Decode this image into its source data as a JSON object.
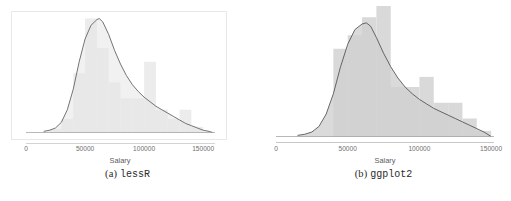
{
  "figure": {
    "panels": [
      {
        "id": "lessR",
        "caption_prefix": "(a)",
        "caption_pkg": "lessR",
        "frame": true,
        "frame_color": "#e8e8e8",
        "axis_label": "Salary",
        "tick_labels": [
          "0",
          "50000",
          "100000",
          "150000"
        ],
        "bar_color": "#ececec",
        "fill_color": "#e6e6e6",
        "curve_color": "#5c5c5c",
        "axis_color": "#c9c9c9"
      },
      {
        "id": "ggplot2",
        "caption_prefix": "(b)",
        "caption_pkg": "ggplot2",
        "frame": false,
        "frame_color": "#ffffff",
        "axis_label": "Salary",
        "tick_labels": [
          "0",
          "50000",
          "100000",
          "150000"
        ],
        "bar_color": "#d9d9d9",
        "fill_color": "#cfcfcf",
        "curve_color": "#4f4f4f",
        "axis_color": "#b9b9b9"
      }
    ]
  },
  "chart_data": [
    {
      "type": "area",
      "title": "",
      "subtitle": "",
      "xlabel": "Salary",
      "ylabel": "",
      "xlim": [
        0,
        160000
      ],
      "ylim": [
        0,
        1
      ],
      "xticks": [
        0,
        50000,
        100000,
        150000
      ],
      "xticklabels": [
        "0",
        "50000",
        "100000",
        "150000"
      ],
      "grid": false,
      "legend": "none",
      "series": [
        {
          "name": "histogram",
          "type": "bar",
          "bin_width": 10000,
          "bin_starts": [
            20000,
            30000,
            40000,
            50000,
            60000,
            70000,
            80000,
            90000,
            100000,
            110000,
            120000,
            130000,
            140000
          ],
          "values": [
            0.03,
            0.12,
            0.52,
            1.0,
            0.74,
            0.44,
            0.3,
            0.3,
            0.62,
            0.2,
            0.12,
            0.2,
            0.05
          ]
        },
        {
          "name": "density",
          "type": "line",
          "x": [
            15000,
            20000,
            25000,
            30000,
            35000,
            40000,
            45000,
            50000,
            55000,
            60000,
            62000,
            65000,
            70000,
            75000,
            80000,
            85000,
            90000,
            95000,
            100000,
            105000,
            110000,
            115000,
            120000,
            125000,
            130000,
            135000,
            140000,
            145000,
            150000,
            155000,
            158000
          ],
          "y": [
            0.01,
            0.02,
            0.04,
            0.09,
            0.2,
            0.38,
            0.62,
            0.82,
            0.94,
            0.99,
            1.0,
            0.97,
            0.86,
            0.72,
            0.6,
            0.5,
            0.42,
            0.36,
            0.31,
            0.27,
            0.23,
            0.2,
            0.17,
            0.14,
            0.11,
            0.08,
            0.06,
            0.04,
            0.02,
            0.01,
            0.0
          ]
        }
      ]
    },
    {
      "type": "area",
      "title": "",
      "subtitle": "",
      "xlabel": "Salary",
      "ylabel": "",
      "xlim": [
        0,
        152000
      ],
      "ylim": [
        0,
        1
      ],
      "xticks": [
        0,
        50000,
        100000,
        150000
      ],
      "xticklabels": [
        "0",
        "50000",
        "100000",
        "150000"
      ],
      "grid": false,
      "legend": "none",
      "series": [
        {
          "name": "histogram",
          "type": "bar",
          "bin_width": 10000,
          "bin_starts": [
            40000,
            50000,
            60000,
            70000,
            80000,
            90000,
            100000,
            110000,
            120000,
            130000,
            140000
          ],
          "values": [
            0.78,
            0.9,
            1.06,
            1.16,
            0.44,
            0.44,
            0.53,
            0.3,
            0.3,
            0.16,
            0.05
          ]
        },
        {
          "name": "density",
          "type": "line",
          "x": [
            15000,
            20000,
            25000,
            30000,
            35000,
            40000,
            45000,
            50000,
            55000,
            60000,
            63000,
            66000,
            70000,
            75000,
            80000,
            85000,
            90000,
            95000,
            100000,
            105000,
            110000,
            115000,
            120000,
            125000,
            130000,
            135000,
            140000,
            145000,
            150000
          ],
          "y": [
            0.01,
            0.02,
            0.04,
            0.09,
            0.2,
            0.38,
            0.62,
            0.82,
            0.95,
            1.0,
            1.01,
            0.98,
            0.88,
            0.74,
            0.62,
            0.52,
            0.44,
            0.38,
            0.33,
            0.29,
            0.25,
            0.22,
            0.19,
            0.16,
            0.13,
            0.1,
            0.07,
            0.04,
            0.0
          ]
        }
      ]
    }
  ]
}
